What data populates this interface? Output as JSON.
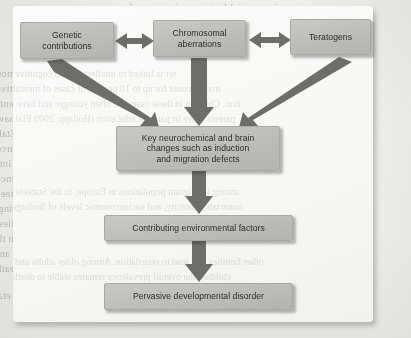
{
  "figure": {
    "type": "flowchart",
    "nodes": [
      {
        "id": "genetic",
        "label": "Genetic contributions",
        "label_lines": [
          "Genetic",
          "contributions"
        ],
        "level": 1
      },
      {
        "id": "chromosomal",
        "label": "Chromosomal aberrations",
        "label_lines": [
          "Chromosomal",
          "aberrations"
        ],
        "level": 1
      },
      {
        "id": "teratogens",
        "label": "Teratogens",
        "label_lines": [
          "Teratogens"
        ],
        "level": 1
      },
      {
        "id": "key",
        "label": "Key neurochemical and brain changes such as induction and migration defects",
        "label_lines": [
          "Key neurochemical and brain",
          "changes such as induction",
          "and migration defects"
        ],
        "level": 2
      },
      {
        "id": "contributing",
        "label": "Contributing environmental factors",
        "label_lines": [
          "Contributing environmental factors"
        ],
        "level": 3
      },
      {
        "id": "pervasive",
        "label": "Pervasive developmental disorder",
        "label_lines": [
          "Pervasive developmental disorder"
        ],
        "level": 4
      }
    ],
    "edges": [
      {
        "from": "genetic",
        "to": "chromosomal",
        "style": "double-arrow",
        "direction": "bidirectional"
      },
      {
        "from": "chromosomal",
        "to": "teratogens",
        "style": "double-arrow",
        "direction": "bidirectional"
      },
      {
        "from": "genetic",
        "to": "key",
        "style": "thick-tapered",
        "direction": "down-right"
      },
      {
        "from": "chromosomal",
        "to": "key",
        "style": "thick-tapered",
        "direction": "down"
      },
      {
        "from": "teratogens",
        "to": "key",
        "style": "thick-tapered",
        "direction": "down-left"
      },
      {
        "from": "key",
        "to": "contributing",
        "style": "thick-tapered",
        "direction": "down"
      },
      {
        "from": "contributing",
        "to": "pervasive",
        "style": "thick-tapered",
        "direction": "down"
      }
    ],
    "colors": {
      "box_fill": "#bfbebb",
      "box_border": "#a9a8a5",
      "arrow": "#6d6b66",
      "text": "#2d2c2a",
      "panel": "#f8f8f5",
      "page": "#eeedea"
    }
  },
  "background": {
    "medium": "scanned book page",
    "bleed_text": [
      "vironmental factors are important for",
      "ctural abnormalities are extensive. The most",
      "ter is linked to intellectual and cognitive",
      "may account for up to 10 percent of cases of mental",
      "tion. Children in these cases are often younger and have",
      "parents leave in parental education (Hodapp, 2009 Etal.",
      "of attention to educational and other resources",
      "programs that have broadened in recent years into",
      "ised in culture, but some have noted a higher prevalence",
      "among immigrant populations in Europe, in the Stateent",
      "materials, ethnicity, and socioeconomic levels of findings",
      "for people with developmental disabilities.",
      "Developmental disorders may also have impacts from the",
      "other families that lead to retardation. Among older adults and",
      "children the overall prevalence remains stable to death",
      "assessment in the clinical and disease settings (Morris etal."
    ]
  }
}
